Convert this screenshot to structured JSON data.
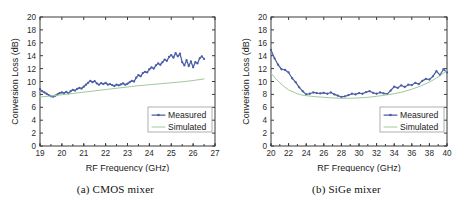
{
  "figure": {
    "panels": [
      {
        "caption_tag": "(a)",
        "caption_text": "CMOS mixer"
      },
      {
        "caption_tag": "(b)",
        "caption_text": "SiGe mixer"
      }
    ]
  },
  "colors": {
    "measured": "#4a5fa5",
    "simulated": "#9fc99a",
    "axis": "#3a3a3a",
    "background": "#ffffff"
  },
  "chart_data": [
    {
      "type": "line",
      "title": "(a) CMOS mixer",
      "xlabel": "RF Frequency (GHz)",
      "ylabel": "Conversion Loss (dB)",
      "xlim": [
        19,
        27
      ],
      "ylim": [
        0,
        20
      ],
      "xticks": [
        19,
        20,
        21,
        22,
        23,
        24,
        25,
        26,
        27
      ],
      "yticks": [
        0,
        2,
        4,
        6,
        8,
        10,
        12,
        14,
        16,
        18,
        20
      ],
      "grid": false,
      "legend_position": "lower-right",
      "series": [
        {
          "name": "Measured",
          "marker": "dot",
          "x": [
            19.0,
            19.1,
            19.2,
            19.3,
            19.4,
            19.5,
            19.6,
            19.7,
            19.8,
            19.9,
            20.0,
            20.1,
            20.2,
            20.3,
            20.4,
            20.5,
            20.6,
            20.7,
            20.8,
            20.9,
            21.0,
            21.1,
            21.2,
            21.3,
            21.4,
            21.5,
            21.6,
            21.7,
            21.8,
            21.9,
            22.0,
            22.1,
            22.2,
            22.3,
            22.4,
            22.5,
            22.6,
            22.7,
            22.8,
            22.9,
            23.0,
            23.1,
            23.2,
            23.3,
            23.4,
            23.5,
            23.6,
            23.7,
            23.8,
            23.9,
            24.0,
            24.1,
            24.2,
            24.3,
            24.4,
            24.5,
            24.6,
            24.7,
            24.8,
            24.9,
            25.0,
            25.1,
            25.2,
            25.3,
            25.4,
            25.5,
            25.6,
            25.7,
            25.8,
            25.9,
            26.0,
            26.1,
            26.2,
            26.3,
            26.4,
            26.5
          ],
          "y": [
            8.8,
            8.5,
            8.3,
            8.1,
            7.9,
            7.7,
            7.65,
            7.8,
            8.0,
            8.2,
            8.3,
            8.2,
            8.4,
            8.15,
            8.5,
            8.7,
            8.6,
            8.85,
            9.0,
            8.9,
            9.2,
            9.5,
            9.8,
            10.1,
            9.9,
            10.05,
            9.7,
            9.5,
            9.75,
            9.6,
            9.8,
            9.5,
            9.6,
            9.45,
            9.3,
            9.5,
            9.4,
            9.55,
            9.7,
            9.5,
            9.65,
            9.9,
            10.1,
            10.0,
            10.6,
            11.0,
            10.8,
            11.3,
            11.5,
            11.4,
            11.9,
            12.2,
            12.0,
            12.5,
            12.8,
            12.6,
            13.0,
            13.4,
            13.2,
            13.8,
            14.1,
            13.7,
            14.4,
            13.9,
            14.3,
            13.0,
            12.5,
            13.3,
            12.4,
            13.1,
            12.2,
            13.0,
            12.8,
            13.6,
            13.9,
            13.5
          ]
        },
        {
          "name": "Simulated",
          "marker": "none",
          "x": [
            19.0,
            19.5,
            20.0,
            20.5,
            21.0,
            21.5,
            22.0,
            22.5,
            23.0,
            23.5,
            24.0,
            24.5,
            25.0,
            25.5,
            26.0,
            26.5
          ],
          "y": [
            7.6,
            7.75,
            7.95,
            8.15,
            8.35,
            8.55,
            8.75,
            8.95,
            9.15,
            9.35,
            9.5,
            9.65,
            9.8,
            9.95,
            10.15,
            10.4
          ]
        }
      ]
    },
    {
      "type": "line",
      "title": "(b) SiGe mixer",
      "xlabel": "RF Frequency (GHz)",
      "ylabel": "Conversion Loss (dB)",
      "xlim": [
        20,
        40
      ],
      "ylim": [
        0,
        20
      ],
      "xticks": [
        20,
        22,
        24,
        26,
        28,
        30,
        32,
        34,
        36,
        38,
        40
      ],
      "yticks": [
        0,
        2,
        4,
        6,
        8,
        10,
        12,
        14,
        16,
        18,
        20
      ],
      "grid": false,
      "legend_position": "lower-right",
      "series": [
        {
          "name": "Measured",
          "marker": "dot",
          "x": [
            20.0,
            20.4,
            20.8,
            21.2,
            21.6,
            22.0,
            22.4,
            22.8,
            23.2,
            23.6,
            24.0,
            24.4,
            24.8,
            25.2,
            25.6,
            26.0,
            26.4,
            26.8,
            27.2,
            27.6,
            28.0,
            28.4,
            28.8,
            29.2,
            29.6,
            30.0,
            30.4,
            30.8,
            31.2,
            31.6,
            32.0,
            32.4,
            32.8,
            33.2,
            33.6,
            34.0,
            34.4,
            34.8,
            35.2,
            35.6,
            36.0,
            36.4,
            36.8,
            37.2,
            37.6,
            38.0,
            38.4,
            38.8,
            39.2,
            39.6,
            40.0
          ],
          "y": [
            14.9,
            13.6,
            12.6,
            11.9,
            11.8,
            11.4,
            10.5,
            9.9,
            9.1,
            8.5,
            8.0,
            8.1,
            8.3,
            8.2,
            8.15,
            8.25,
            8.1,
            8.3,
            8.0,
            7.8,
            7.6,
            7.7,
            7.9,
            8.1,
            8.0,
            8.2,
            8.1,
            8.35,
            8.5,
            8.25,
            8.1,
            8.3,
            8.15,
            8.05,
            8.6,
            9.2,
            9.0,
            9.4,
            9.15,
            9.5,
            9.45,
            9.8,
            9.6,
            10.1,
            10.4,
            10.3,
            10.8,
            11.6,
            11.0,
            11.9,
            11.4
          ]
        },
        {
          "name": "Simulated",
          "marker": "none",
          "x": [
            20.0,
            20.5,
            21.0,
            21.5,
            22.0,
            22.5,
            23.0,
            23.5,
            24.0,
            25.0,
            26.0,
            27.0,
            28.0,
            29.0,
            30.0,
            31.0,
            32.0,
            33.0,
            34.0,
            35.0,
            36.0,
            37.0,
            38.0,
            39.0,
            40.0
          ],
          "y": [
            11.3,
            10.5,
            9.8,
            9.2,
            8.7,
            8.4,
            8.1,
            7.9,
            7.8,
            7.65,
            7.55,
            7.45,
            7.4,
            7.4,
            7.45,
            7.55,
            7.7,
            7.9,
            8.1,
            8.4,
            8.8,
            9.3,
            9.9,
            10.7,
            11.7
          ]
        }
      ]
    }
  ]
}
